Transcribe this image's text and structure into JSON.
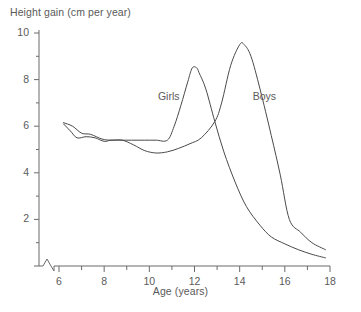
{
  "chart_data": {
    "type": "line",
    "title": "",
    "ylabel": "Height gain (cm per year)",
    "xlabel": "Age (years)",
    "xlim": [
      5.0,
      18.0
    ],
    "ylim": [
      0,
      10
    ],
    "grid": false,
    "legend_position": "inline-annotations",
    "axis_break": "x-axis break between origin and age 6",
    "y_ticks_major": [
      "0",
      "2",
      "4",
      "6",
      "8",
      "10"
    ],
    "y_ticks_major_values": [
      0,
      2,
      4,
      6,
      8,
      10
    ],
    "y_ticks_minor_values": [
      1,
      3,
      5,
      7,
      9
    ],
    "x_ticks_major": [
      "6",
      "8",
      "10",
      "12",
      "14",
      "16",
      "18"
    ],
    "x_ticks_major_values": [
      6,
      8,
      10,
      12,
      14,
      16,
      18
    ],
    "x_ticks_minor_values": [
      7,
      9,
      11,
      13,
      15,
      17
    ],
    "series": [
      {
        "name": "Girls",
        "label_x": 11.0,
        "label_y": 7.25,
        "peak_age": 12.0,
        "peak_value": 8.5,
        "x": [
          6.2,
          6.5,
          6.8,
          7.2,
          7.6,
          8.0,
          8.3,
          8.7,
          9.2,
          9.8,
          10.3,
          10.8,
          11.1,
          11.4,
          11.7,
          11.9,
          12.1,
          12.2,
          12.5,
          12.9,
          13.3,
          13.8,
          14.3,
          14.9,
          15.4,
          16.0,
          16.6,
          17.2,
          17.8
        ],
        "y": [
          6.1,
          5.8,
          5.5,
          5.55,
          5.5,
          5.35,
          5.4,
          5.4,
          5.4,
          5.4,
          5.4,
          5.4,
          6.0,
          6.9,
          7.9,
          8.5,
          8.5,
          8.3,
          7.6,
          6.2,
          4.9,
          3.6,
          2.55,
          1.75,
          1.25,
          0.95,
          0.7,
          0.5,
          0.35
        ]
      },
      {
        "name": "Boys",
        "label_x": 15.2,
        "label_y": 7.25,
        "peak_age": 14.0,
        "peak_value": 9.5,
        "x": [
          6.2,
          6.6,
          7.0,
          7.4,
          7.9,
          8.3,
          8.8,
          9.3,
          9.8,
          10.3,
          10.8,
          11.3,
          11.8,
          12.3,
          12.9,
          13.2,
          13.6,
          14.0,
          14.2,
          14.5,
          14.9,
          15.4,
          15.8,
          16.2,
          16.7,
          17.2,
          17.8
        ],
        "y": [
          6.15,
          6.0,
          5.7,
          5.65,
          5.45,
          5.4,
          5.4,
          5.2,
          4.95,
          4.85,
          4.9,
          5.05,
          5.25,
          5.5,
          6.2,
          7.0,
          8.6,
          9.5,
          9.5,
          9.0,
          7.6,
          5.6,
          3.9,
          2.0,
          1.45,
          1.0,
          0.7
        ]
      }
    ]
  },
  "colors": {
    "background": "#ffffff",
    "axis": "#6b6b6b",
    "line": "#4a4a4a",
    "text": "#5a5a5a"
  }
}
